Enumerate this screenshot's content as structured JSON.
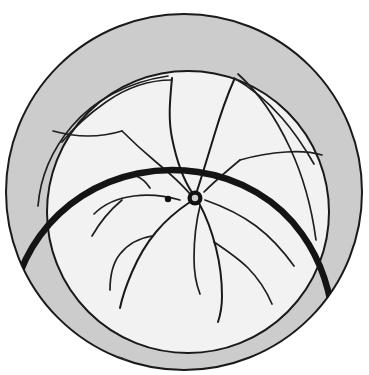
{
  "figure": {
    "title": "Retinal fundus schematic drawing",
    "type": "medical-illustration",
    "caption": ""
  },
  "colors": {
    "background": "#ffffff",
    "peripheral_fill": "#cccccc",
    "inner_fill": "#f2f2f2",
    "outline": "#1a1a1a",
    "thick_arc": "#141414",
    "disc": "#111111",
    "lesion": "#333333"
  },
  "geometry": {
    "canvas_width": 369,
    "canvas_height": 375,
    "outer_circle": {
      "cx": 184,
      "cy": 192,
      "r": 178
    },
    "inner_circle": {
      "cx": 188,
      "cy": 212,
      "r": 141
    },
    "optic_disc": {
      "cx": 195,
      "cy": 198,
      "r": 7.5
    },
    "macula_dot": {
      "cx": 168,
      "cy": 199,
      "r": 3.2
    },
    "lesion_blob": {
      "cx": 117,
      "cy": 363,
      "rx": 11,
      "ry": 7
    }
  },
  "parts": [
    {
      "id": "outer-boundary",
      "label": "Ora serrata / peripheral retina boundary"
    },
    {
      "id": "inner-boundary",
      "label": "Equator reference circle"
    },
    {
      "id": "detachment-arc",
      "label": "Retinal detachment border"
    },
    {
      "id": "optic-disc",
      "label": "Optic disc"
    },
    {
      "id": "macula",
      "label": "Macula"
    },
    {
      "id": "vessel-tree",
      "label": "Retinal vessel arcades"
    },
    {
      "id": "retinal-break",
      "label": "Inferior retinal break"
    }
  ],
  "annotations": {
    "count": 0,
    "labels": []
  }
}
